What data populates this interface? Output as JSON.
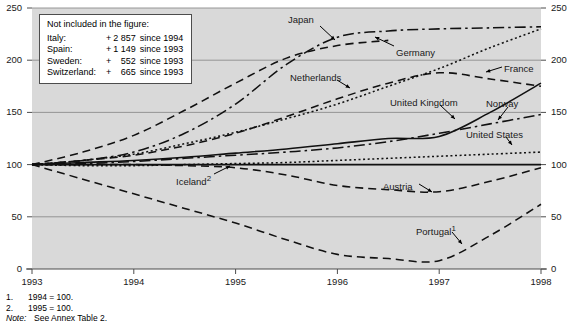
{
  "chart_data": {
    "type": "line",
    "title": "",
    "subtitle": "",
    "xlabel": "",
    "ylabel": "",
    "xlim": [
      1993,
      1998
    ],
    "ylim": [
      0,
      250
    ],
    "x_ticks": [
      "1993",
      "1994",
      "1995",
      "1996",
      "1997",
      "1998"
    ],
    "y_ticks": [
      "0",
      "50",
      "100",
      "150",
      "200",
      "250"
    ],
    "y_ticks_right": [
      "0",
      "50",
      "100",
      "150",
      "200",
      "250"
    ],
    "grid": true,
    "legend_position": "inline-annotations",
    "index_base": "1993 = 100",
    "x": [
      1993,
      1993.5,
      1994,
      1994.5,
      1995,
      1995.5,
      1996,
      1996.5,
      1997,
      1997.5,
      1998
    ],
    "series": [
      {
        "name": "Japan",
        "style": "dash-dot",
        "values": [
          100,
          104,
          112,
          130,
          158,
          196,
          222,
          228,
          230,
          231,
          232
        ]
      },
      {
        "name": "Germany",
        "style": "dashed",
        "values": [
          100,
          112,
          128,
          152,
          178,
          202,
          214,
          219,
          null,
          null,
          null
        ]
      },
      {
        "name": "Netherlands",
        "style": "dotted",
        "values": [
          100,
          104,
          110,
          120,
          131,
          144,
          158,
          175,
          192,
          212,
          230
        ]
      },
      {
        "name": "France",
        "style": "dashed",
        "values": [
          100,
          104,
          109,
          118,
          130,
          146,
          163,
          178,
          188,
          182,
          175
        ]
      },
      {
        "name": "United Kingdom",
        "style": "solid",
        "values": [
          100,
          102,
          104,
          107,
          111,
          115,
          120,
          125,
          127,
          150,
          178
        ]
      },
      {
        "name": "Norway",
        "style": "dash-dot",
        "values": [
          100,
          101,
          103,
          106,
          109,
          112,
          116,
          122,
          130,
          139,
          148
        ]
      },
      {
        "name": "United States",
        "style": "dotted",
        "values": [
          100,
          99,
          99,
          100,
          101,
          102,
          104,
          106,
          108,
          110,
          112
        ]
      },
      {
        "name": "Iceland",
        "style": "solid",
        "values": [
          100,
          100,
          100,
          100,
          100,
          100,
          100,
          100,
          100,
          100,
          100
        ],
        "footnote": "2"
      },
      {
        "name": "Austria",
        "style": "dashed",
        "values": [
          100,
          100,
          100,
          99,
          97,
          90,
          80,
          76,
          74,
          84,
          97
        ]
      },
      {
        "name": "Portugal",
        "style": "dashed",
        "values": [
          100,
          86,
          72,
          58,
          44,
          28,
          14,
          10,
          8,
          32,
          62
        ],
        "footnote": "1"
      }
    ],
    "series_labels": [
      {
        "name": "Japan",
        "text": "Japan",
        "x": 288,
        "y": 15
      },
      {
        "name": "Germany",
        "text": "Germany",
        "x": 396,
        "y": 48
      },
      {
        "name": "Netherlands",
        "text": "Netherlands",
        "x": 290,
        "y": 73
      },
      {
        "name": "France",
        "text": "France",
        "x": 504,
        "y": 64
      },
      {
        "name": "United Kingdom",
        "text": "United Kingdom",
        "x": 390,
        "y": 98
      },
      {
        "name": "Norway",
        "text": "Norway",
        "x": 486,
        "y": 99
      },
      {
        "name": "United States",
        "text": "United States",
        "x": 466,
        "y": 130
      },
      {
        "name": "Iceland",
        "text": "Iceland",
        "footnote": "2",
        "x": 176,
        "y": 174
      },
      {
        "name": "Austria",
        "text": "Austria",
        "x": 383,
        "y": 182
      },
      {
        "name": "Portugal",
        "text": "Portugal",
        "footnote": "1",
        "x": 416,
        "y": 224
      }
    ]
  },
  "note_box": {
    "title": "Not included in the figure:",
    "rows": [
      {
        "country": "Italy:",
        "sign": "+",
        "value": "2 857",
        "since": "since 1994"
      },
      {
        "country": "Spain:",
        "sign": "+",
        "value": "1 149",
        "since": "since 1993"
      },
      {
        "country": "Sweden:",
        "sign": "+",
        "value": "552",
        "since": "since 1993"
      },
      {
        "country": "Switzerland:",
        "sign": "+",
        "value": "665",
        "since": "since 1993"
      }
    ]
  },
  "footnotes": {
    "items": [
      {
        "num": "1.",
        "text": "1994 = 100."
      },
      {
        "num": "2.",
        "text": "1995 = 100."
      }
    ],
    "note_label": "Note:",
    "note_text": "See Annex Table 2."
  },
  "colors": {
    "plot_background": "#d9d9d9",
    "grid_line": "#8c8c8c",
    "axis_line": "#4d4d4d",
    "series_line": "#111111",
    "page_background": "#ffffff",
    "text": "#000000"
  }
}
